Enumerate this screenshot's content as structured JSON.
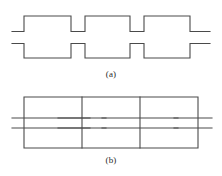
{
  "figure": {
    "background_color": "#ffffff",
    "line_color": "#4a4a4a",
    "line_width": 1.1,
    "panels": [
      {
        "id": "a",
        "caption": "(a)",
        "name": "castellated-meander-line",
        "description": "Square-wave / castellated conductor outline with two lead stubs at left and two lead stubs at right",
        "viewbox": {
          "x": 0,
          "y": 0,
          "width": 222,
          "height": 88
        },
        "geometry": {
          "outer_top_y": 16,
          "outer_bottom_y": 58,
          "notch_top_y": 31.5,
          "notch_bottom_y": 43.5,
          "stub_left_x": 12,
          "stub_right_x": 210,
          "left_wall_x": 24,
          "right_wall_x": 198,
          "cell_edges_x": [
            24,
            71,
            85,
            130,
            144,
            198
          ],
          "upper_path": "M 12 31.5 L 24 31.5 L 24 16 L 71 16 L 71 31.5 L 85 31.5 L 85 16 L 130 16 L 130 31.5 L 144 31.5 L 144 16 L 190 16 L 190 31.5 L 210 31.5",
          "lower_path": "M 12 43.5 L 24 43.5 L 24 58 L 71 58 L 71 43.5 L 85 43.5 L 85 58 L 130 58 L 130 43.5 L 144 43.5 L 144 58 L 190 58 L 190 43.5 L 210 43.5"
        }
      },
      {
        "id": "b",
        "caption": "(b)",
        "name": "equivalent-circuit",
        "description": "Ladder network: rectangular loop with three vertical rungs and four series capacitor plate pairs on the center line",
        "viewbox": {
          "x": 0,
          "y": 88,
          "width": 222,
          "height": 88
        },
        "geometry": {
          "rail_top_y": 97,
          "rail_bottom_y": 148,
          "loop_left_x": 24,
          "loop_right_x": 198,
          "rung_x": [
            82,
            140,
            198
          ],
          "plate_upper_y": 118,
          "plate_lower_y": 128,
          "lead_left_x": 12,
          "lead_right_x": 212,
          "capacitors": [
            {
              "name": "capacitor-1",
              "center_x": 50,
              "plate_half_width": 40
            },
            {
              "name": "capacitor-2",
              "center_x": 82,
              "plate_half_width": 24
            },
            {
              "name": "capacitor-3",
              "center_x": 140,
              "plate_half_width": 38
            },
            {
              "name": "capacitor-4",
              "center_x": 198,
              "plate_half_width": 24
            }
          ]
        }
      }
    ]
  }
}
